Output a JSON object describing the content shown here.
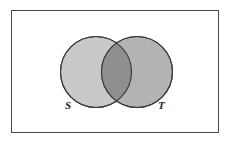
{
  "figure": {
    "name": "venn-diagram",
    "background_color": "#ffffff"
  },
  "universe": {
    "name": "universe-rectangle",
    "border_color": "#4a4a4a",
    "fill_color": "#ffffff",
    "x": 11,
    "y": 10,
    "width": 208,
    "height": 123
  },
  "sets": [
    {
      "id": "S",
      "label": "S",
      "fill_color": "#c9c9c9",
      "stroke_color": "#3a3a3a",
      "cx": 96,
      "cy": 72,
      "r": 35.5,
      "label_x": 65,
      "label_y": 100
    },
    {
      "id": "T",
      "label": "T",
      "fill_color": "#a9a9a9",
      "stroke_color": "#3a3a3a",
      "cx": 137,
      "cy": 72,
      "r": 35.5,
      "label_x": 158,
      "label_y": 100
    }
  ],
  "intersection": {
    "name": "intersection-region",
    "fill_color": "#8f8f8f",
    "label": ""
  },
  "chart_data": {
    "type": "venn",
    "title": "",
    "sets": [
      "S",
      "T"
    ],
    "set_labels": [
      "S",
      "T"
    ],
    "relationship": "overlapping",
    "universe_shown": true,
    "regions": [
      {
        "name": "S only",
        "shade": "#c9c9c9"
      },
      {
        "name": "S and T",
        "shade": "#8f8f8f"
      },
      {
        "name": "T only",
        "shade": "#a9a9a9"
      },
      {
        "name": "outside S and T",
        "shade": "#ffffff"
      }
    ]
  }
}
